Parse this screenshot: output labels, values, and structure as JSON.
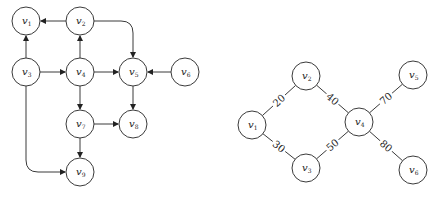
{
  "left_graph": {
    "type": "directed",
    "nodes": [
      {
        "id": "v1",
        "label": "v",
        "sub": "1",
        "x": 26,
        "y": 21
      },
      {
        "id": "v2",
        "label": "v",
        "sub": "2",
        "x": 80,
        "y": 21
      },
      {
        "id": "v3",
        "label": "v",
        "sub": "3",
        "x": 26,
        "y": 72
      },
      {
        "id": "v4",
        "label": "v",
        "sub": "4",
        "x": 80,
        "y": 72
      },
      {
        "id": "v5",
        "label": "v",
        "sub": "5",
        "x": 133,
        "y": 72
      },
      {
        "id": "v6",
        "label": "v",
        "sub": "6",
        "x": 185,
        "y": 72
      },
      {
        "id": "v7",
        "label": "v",
        "sub": "7",
        "x": 80,
        "y": 124
      },
      {
        "id": "v8",
        "label": "v",
        "sub": "8",
        "x": 133,
        "y": 124
      },
      {
        "id": "v9",
        "label": "v",
        "sub": "9",
        "x": 80,
        "y": 172
      }
    ],
    "edges": [
      {
        "from": "v2",
        "to": "v1"
      },
      {
        "from": "v2",
        "to": "v5"
      },
      {
        "from": "v3",
        "to": "v1"
      },
      {
        "from": "v3",
        "to": "v4"
      },
      {
        "from": "v3",
        "to": "v9"
      },
      {
        "from": "v4",
        "to": "v2"
      },
      {
        "from": "v4",
        "to": "v5"
      },
      {
        "from": "v4",
        "to": "v7"
      },
      {
        "from": "v6",
        "to": "v5"
      },
      {
        "from": "v5",
        "to": "v8"
      },
      {
        "from": "v7",
        "to": "v8"
      },
      {
        "from": "v7",
        "to": "v9"
      }
    ]
  },
  "right_graph": {
    "type": "undirected-weighted",
    "nodes": [
      {
        "id": "v1",
        "label": "v",
        "sub": "1",
        "x": 252,
        "y": 125
      },
      {
        "id": "v2",
        "label": "v",
        "sub": "2",
        "x": 306,
        "y": 76
      },
      {
        "id": "v3",
        "label": "v",
        "sub": "3",
        "x": 306,
        "y": 168
      },
      {
        "id": "v4",
        "label": "v",
        "sub": "4",
        "x": 359,
        "y": 122
      },
      {
        "id": "v5",
        "label": "v",
        "sub": "5",
        "x": 413,
        "y": 75
      },
      {
        "id": "v6",
        "label": "v",
        "sub": "6",
        "x": 413,
        "y": 170
      }
    ],
    "edges": [
      {
        "from": "v1",
        "to": "v2",
        "weight": "20"
      },
      {
        "from": "v1",
        "to": "v3",
        "weight": "30"
      },
      {
        "from": "v2",
        "to": "v4",
        "weight": "40"
      },
      {
        "from": "v3",
        "to": "v4",
        "weight": "50"
      },
      {
        "from": "v4",
        "to": "v5",
        "weight": "70"
      },
      {
        "from": "v4",
        "to": "v6",
        "weight": "80"
      }
    ]
  }
}
